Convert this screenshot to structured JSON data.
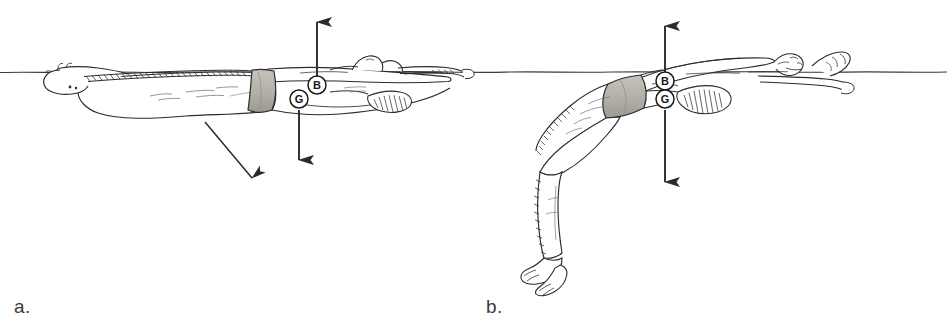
{
  "figure": {
    "background_color": "#ffffff",
    "ink_color": "#2b2b2b",
    "suit_fill_color": "#b8b4ae",
    "water_line_color": "#3a3a3a",
    "width": 947,
    "height": 332,
    "waterline_y": 72
  },
  "panels": [
    {
      "id": "panel-a",
      "caption": "a.",
      "description": "Swimmer in prone horizontal float, legs extended, body near water surface",
      "force_labels": [
        {
          "key": "B",
          "name": "center-of-buoyancy",
          "cx": 317,
          "cy": 85,
          "r": 9
        },
        {
          "key": "G",
          "name": "center-of-gravity",
          "cx": 299,
          "cy": 99,
          "r": 9
        }
      ],
      "arrows": [
        {
          "name": "buoyancy-arrow-up",
          "x1": 317,
          "y1": 76,
          "x2": 317,
          "y2": 16,
          "direction": "up"
        },
        {
          "name": "gravity-arrow-down",
          "x1": 299,
          "y1": 108,
          "x2": 299,
          "y2": 168,
          "direction": "down"
        },
        {
          "name": "leg-sink-arrow",
          "x1": 205,
          "y1": 122,
          "x2": 258,
          "y2": 186,
          "direction": "down-right"
        }
      ]
    },
    {
      "id": "panel-b",
      "caption": "b.",
      "description": "Swimmer in supine tuck float, knees bent with legs hanging below the surface",
      "force_labels": [
        {
          "key": "B",
          "name": "center-of-buoyancy",
          "cx": 665,
          "cy": 81,
          "r": 9
        },
        {
          "key": "G",
          "name": "center-of-gravity",
          "cx": 665,
          "cy": 99,
          "r": 9
        }
      ],
      "arrows": [
        {
          "name": "buoyancy-arrow-up",
          "x1": 665,
          "y1": 72,
          "x2": 665,
          "y2": 20,
          "direction": "up"
        },
        {
          "name": "gravity-arrow-down",
          "x1": 665,
          "y1": 108,
          "x2": 665,
          "y2": 190,
          "direction": "down"
        }
      ]
    }
  ],
  "legend": {
    "B": "Center of buoyancy",
    "G": "Center of gravity"
  }
}
